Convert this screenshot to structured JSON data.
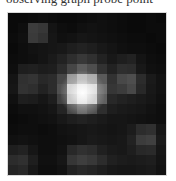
{
  "caption": {
    "text": "observing graph probe point"
  },
  "image": {
    "subject": "pixelated point source (star) on dark background",
    "grid_cols": 16,
    "grid_rows": 16,
    "pixels": [
      [
        10,
        10,
        12,
        14,
        12,
        10,
        10,
        12,
        14,
        16,
        14,
        12,
        10,
        10,
        12,
        10
      ],
      [
        10,
        14,
        60,
        55,
        20,
        14,
        12,
        16,
        18,
        16,
        14,
        12,
        10,
        10,
        12,
        12
      ],
      [
        12,
        16,
        58,
        50,
        22,
        16,
        18,
        22,
        20,
        18,
        16,
        14,
        12,
        12,
        10,
        12
      ],
      [
        10,
        14,
        18,
        20,
        22,
        24,
        30,
        34,
        30,
        24,
        20,
        16,
        14,
        14,
        12,
        10
      ],
      [
        12,
        14,
        16,
        20,
        26,
        34,
        46,
        56,
        48,
        34,
        24,
        30,
        34,
        20,
        14,
        12
      ],
      [
        14,
        30,
        32,
        28,
        30,
        44,
        70,
        92,
        78,
        50,
        34,
        46,
        44,
        24,
        16,
        14
      ],
      [
        20,
        48,
        52,
        40,
        44,
        70,
        150,
        190,
        170,
        90,
        50,
        72,
        78,
        44,
        26,
        18
      ],
      [
        22,
        50,
        46,
        34,
        44,
        80,
        220,
        250,
        235,
        110,
        54,
        60,
        72,
        40,
        24,
        18
      ],
      [
        16,
        30,
        28,
        22,
        30,
        64,
        200,
        240,
        215,
        96,
        40,
        34,
        30,
        26,
        22,
        16
      ],
      [
        12,
        16,
        16,
        18,
        22,
        36,
        70,
        96,
        80,
        46,
        30,
        26,
        24,
        22,
        18,
        14
      ],
      [
        10,
        12,
        14,
        16,
        18,
        24,
        30,
        34,
        30,
        26,
        22,
        22,
        20,
        18,
        16,
        14
      ],
      [
        12,
        14,
        14,
        12,
        14,
        18,
        20,
        22,
        24,
        22,
        20,
        22,
        28,
        44,
        48,
        22
      ],
      [
        16,
        18,
        16,
        14,
        14,
        16,
        18,
        22,
        26,
        24,
        22,
        24,
        34,
        60,
        64,
        26
      ],
      [
        30,
        34,
        22,
        14,
        14,
        18,
        40,
        48,
        44,
        32,
        26,
        24,
        30,
        40,
        42,
        22
      ],
      [
        44,
        48,
        30,
        16,
        16,
        22,
        54,
        62,
        56,
        44,
        32,
        28,
        26,
        28,
        30,
        20
      ],
      [
        36,
        40,
        24,
        14,
        14,
        18,
        34,
        40,
        36,
        30,
        24,
        22,
        22,
        24,
        26,
        18
      ]
    ],
    "colors": {
      "background": "#050505",
      "core": "#ffffff",
      "border": "#d8d8d8"
    }
  }
}
